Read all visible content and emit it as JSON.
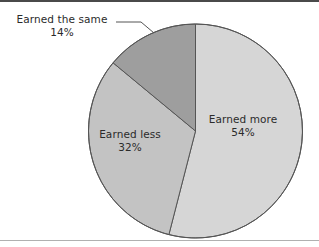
{
  "chart_data": {
    "type": "pie",
    "title": "",
    "subtitle": "",
    "xlabel": "",
    "ylabel": "",
    "legend_position": "none",
    "grid": false,
    "start_angle_deg": 0,
    "direction": "clockwise",
    "categories": [
      "Earned more",
      "Earned less",
      "Earned the same"
    ],
    "values": [
      54,
      32,
      14
    ],
    "value_unit": "%",
    "labels": [
      "54%",
      "32%",
      "14%"
    ],
    "colors": [
      "#d6d6d6",
      "#c3c3c3",
      "#9e9e9e"
    ],
    "slices": [
      {
        "name": "Earned more",
        "value": 54,
        "value_label": "54%",
        "color": "#d6d6d6",
        "label_placement": "inside"
      },
      {
        "name": "Earned less",
        "value": 32,
        "value_label": "32%",
        "color": "#c3c3c3",
        "label_placement": "inside"
      },
      {
        "name": "Earned the same",
        "value": 14,
        "value_label": "14%",
        "color": "#9e9e9e",
        "label_placement": "outside-leader"
      }
    ]
  },
  "figure": {
    "border_color": "#4a4a4a",
    "rule_color": "#b0b0b0",
    "background": "#ffffff",
    "slice_outline_color": "#555555",
    "leader_line_color": "#555555",
    "text_color": "#2b2b2b"
  }
}
